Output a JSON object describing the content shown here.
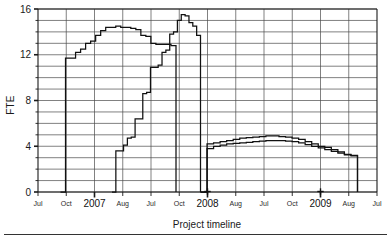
{
  "chart_data": {
    "type": "line",
    "title": "",
    "xlabel": "Project timeline",
    "ylabel": "FTE",
    "ylim": [
      0,
      16
    ],
    "yticks": [
      0,
      4,
      8,
      12,
      16
    ],
    "ytick_labels": [
      "0",
      "4",
      "8",
      "12",
      "16"
    ],
    "y_minor_step": 1,
    "grid": true,
    "legend": "none",
    "xlim": [
      2006.5,
      2010.5
    ],
    "xtick_positions": [
      2006.5,
      2006.75,
      2007.0,
      2007.58,
      2007.5,
      2008.0,
      2008.0,
      2008.58,
      2008.5,
      2009.0,
      2009.0,
      2009.58,
      2010.5
    ],
    "xtick_labels": [
      "Jul",
      "Oct",
      "2007",
      "Aug",
      "Jul",
      "Oct",
      "2008",
      "Aug",
      "Jul",
      "Oct",
      "2009",
      "Aug",
      "Jul"
    ],
    "x_axis_note": "Quarterly ticks from Jul 2006 through Jul 2010; year labels 2007, 2008, 2009 replace the Jan tick label",
    "annotations": [
      {
        "label": "milestone-marker",
        "symbol": "+",
        "x": 2008.0,
        "y": 0
      },
      {
        "label": "milestone-marker",
        "symbol": "+",
        "x": 2009.0,
        "y": 0
      }
    ],
    "series": [
      {
        "name": "Series A (early phase staffing)",
        "style": "step",
        "x_start": "Sep 2006",
        "x_end": "Mar 2008",
        "values": [
          0,
          11.7,
          11.7,
          12.2,
          12.5,
          13.0,
          13.2,
          13.7,
          14.1,
          14.4,
          14.4,
          14.5,
          14.4,
          14.4,
          14.3,
          14.2,
          13.7,
          13.6,
          13.0,
          12.9,
          12.9,
          12.9,
          12.8,
          0
        ]
      },
      {
        "name": "Series B (later phase staffing)",
        "style": "step",
        "x_start": "Feb 2007",
        "x_end": "Mar 2008",
        "values": [
          0,
          3.6,
          3.6,
          4.1,
          4.7,
          4.8,
          6.4,
          6.4,
          8.6,
          8.7,
          10.9,
          10.9,
          11.1,
          12.2,
          12.4,
          13.8,
          14.0,
          15.0,
          15.5,
          15.4,
          14.8,
          14.5,
          13.7,
          0
        ]
      },
      {
        "name": "Series C (sustain phase, upper)",
        "style": "step",
        "x_start": "Mar 2008",
        "x_end": "Oct 2009",
        "values": [
          0,
          4.2,
          4.3,
          4.4,
          4.5,
          4.6,
          4.7,
          4.75,
          4.8,
          4.85,
          4.9,
          4.9,
          4.85,
          4.8,
          4.7,
          4.6,
          4.4,
          4.2,
          4.0,
          3.9,
          3.7,
          3.5,
          3.3,
          3.2,
          0
        ]
      },
      {
        "name": "Series D (sustain phase, lower)",
        "style": "step",
        "x_start": "Mar 2008",
        "x_end": "Oct 2009",
        "values": [
          0,
          3.8,
          4.0,
          4.1,
          4.2,
          4.25,
          4.3,
          4.35,
          4.4,
          4.45,
          4.5,
          4.5,
          4.5,
          4.45,
          4.4,
          4.3,
          4.15,
          4.0,
          3.85,
          3.7,
          3.55,
          3.4,
          3.25,
          3.15,
          0
        ]
      }
    ]
  }
}
